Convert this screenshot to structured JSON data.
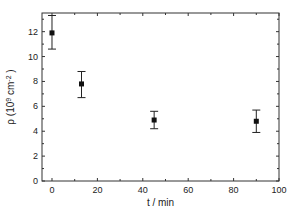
{
  "chart_data": {
    "type": "scatter",
    "title": "",
    "xlabel": "t / min",
    "ylabel": "ρ  (10⁹ cm⁻²)",
    "ylabel_parts": {
      "symbol": "ρ",
      "open": "(10",
      "exp": "9",
      "unit": " cm",
      "unit_exp": "-2",
      "close": ")"
    },
    "xlim": [
      -4.4,
      100
    ],
    "ylim": [
      0,
      13.5
    ],
    "xticks": [
      0,
      20,
      40,
      60,
      80,
      100
    ],
    "yticks": [
      0,
      2,
      4,
      6,
      8,
      10,
      12
    ],
    "grid": false,
    "legend": null,
    "series": [
      {
        "name": "ρ",
        "marker": "square",
        "x": [
          0,
          13,
          45,
          90
        ],
        "y": [
          11.9,
          7.8,
          4.9,
          4.8
        ],
        "err_low": [
          10.6,
          6.7,
          4.2,
          3.9
        ],
        "err_high": [
          13.3,
          8.8,
          5.6,
          5.7
        ]
      }
    ]
  }
}
